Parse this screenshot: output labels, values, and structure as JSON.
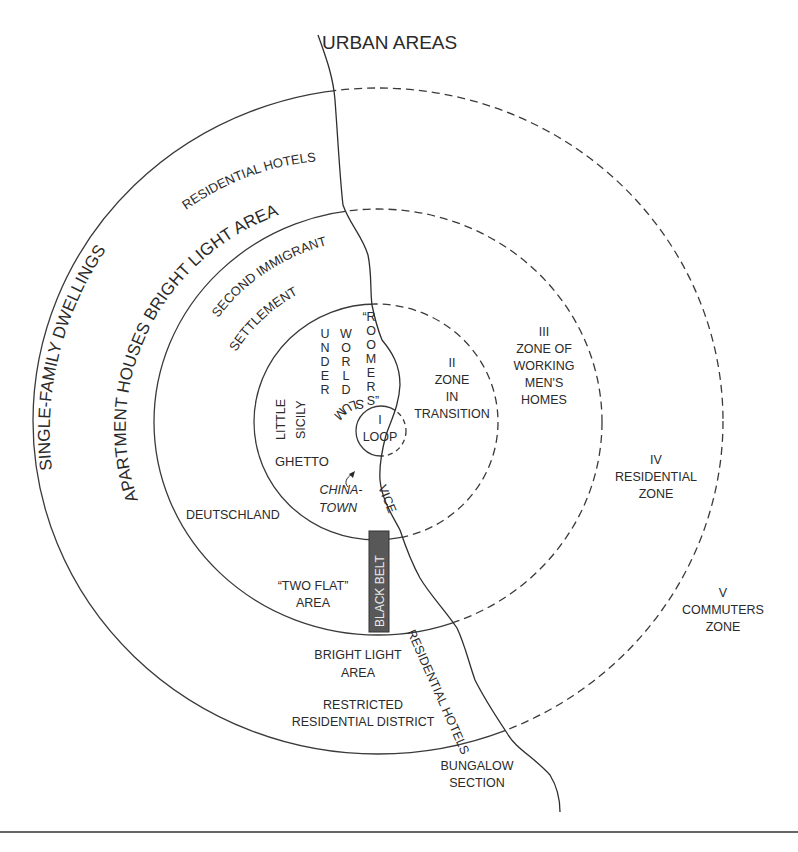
{
  "title": "URBAN AREAS",
  "zones": {
    "I": {
      "numeral": "I",
      "name": "LOOP"
    },
    "II": {
      "numeral": "II",
      "lines": [
        "ZONE",
        "IN",
        "TRANSITION"
      ]
    },
    "III": {
      "numeral": "III",
      "lines": [
        "ZONE OF",
        "WORKING",
        "MEN'S",
        "HOMES"
      ]
    },
    "IV": {
      "numeral": "IV",
      "lines": [
        "RESIDENTIAL",
        "ZONE"
      ]
    },
    "V": {
      "numeral": "V",
      "lines": [
        "COMMUTERS",
        "ZONE"
      ]
    }
  },
  "arc_labels": {
    "single_family": "SINGLE-FAMILY DWELLINGS",
    "residential_hotels_top": "RESIDENTIAL HOTELS",
    "apartment_houses": "APARTMENT HOUSES BRIGHT LIGHT AREA",
    "second_immigrant": "SECOND IMMIGRANT",
    "settlement": "SETTLEMENT"
  },
  "inner_labels": {
    "underworld": [
      "U",
      "N",
      "D",
      "E",
      "R"
    ],
    "world": [
      "W",
      "O",
      "R",
      "L",
      "D"
    ],
    "roomers": [
      "“R",
      "O",
      "O",
      "M",
      "E",
      "R",
      "S”"
    ],
    "little": "LITTLE",
    "sicily": "SICILY",
    "slum": "SLUM",
    "ghetto": "GHETTO",
    "chinatown": [
      "CHINA-",
      "TOWN"
    ],
    "vice": "VICE",
    "deutschland": "DEUTSCHLAND",
    "two_flat": [
      "“TWO FLAT”",
      "AREA"
    ],
    "black_belt": "BLACK BELT",
    "bright_light": [
      "BRIGHT LIGHT",
      "AREA"
    ],
    "restricted": [
      "RESTRICTED",
      "RESIDENTIAL DISTRICT"
    ],
    "residential_hotels_shore": "RESIDENTIAL HOTELS",
    "bungalow": [
      "BUNGALOW",
      "SECTION"
    ]
  },
  "colors": {
    "line": "#3a3a3a",
    "black_belt_fill": "#585858",
    "black_belt_text": "#e8e8e8",
    "text": "#2a2a2a"
  }
}
